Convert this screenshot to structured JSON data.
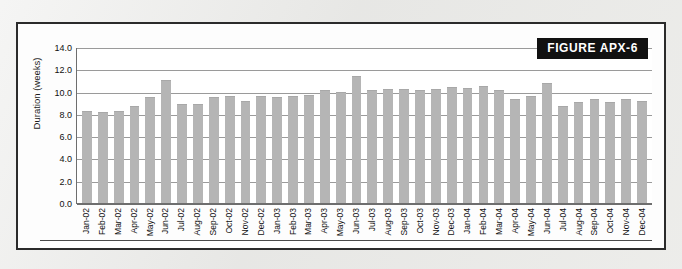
{
  "figure": {
    "tag_label": "FIGURE APX-6"
  },
  "chart_data": {
    "type": "bar",
    "title": "FIGURE APX-6",
    "xlabel": "",
    "ylabel": "Duration (weeks)",
    "ylim": [
      0.0,
      14.0
    ],
    "ytick_labels": [
      "14.0",
      "12.0",
      "10.0",
      "8.0",
      "6.0",
      "4.0",
      "2.0",
      "0.0"
    ],
    "ytick_values": [
      14.0,
      12.0,
      10.0,
      8.0,
      6.0,
      4.0,
      2.0,
      0.0
    ],
    "grid": true,
    "legend": "none",
    "bar_color": "#b5b5b5",
    "categories": [
      "Jan-02",
      "Feb-02",
      "Mar-02",
      "Apr-02",
      "May-02",
      "Jun-02",
      "Jul-02",
      "Aug-02",
      "Sep-02",
      "Oct-02",
      "Nov-02",
      "Dec-02",
      "Jan-03",
      "Feb-03",
      "Mar-03",
      "Apr-03",
      "May-03",
      "Jun-03",
      "Jul-03",
      "Aug-03",
      "Sep-03",
      "Oct-03",
      "Nov-03",
      "Dec-03",
      "Jan-04",
      "Feb-04",
      "Mar-04",
      "Apr-04",
      "May-04",
      "Jun-04",
      "Jul-04",
      "Aug-04",
      "Sep-04",
      "Oct-04",
      "Nov-04",
      "Dec-04"
    ],
    "values": [
      8.3,
      8.2,
      8.3,
      8.7,
      9.5,
      11.0,
      8.9,
      8.9,
      9.5,
      9.6,
      9.2,
      9.6,
      9.5,
      9.6,
      9.7,
      10.1,
      10.0,
      11.4,
      10.1,
      10.2,
      10.2,
      10.1,
      10.2,
      10.4,
      10.3,
      10.5,
      10.1,
      9.3,
      9.6,
      10.8,
      8.7,
      9.1,
      9.3,
      9.1,
      9.3,
      9.2
    ]
  },
  "colors": {
    "page_background": "#e9e9e7",
    "panel_background": "#fdfdfd",
    "panel_border": "#2b2b2b",
    "tag_background": "#111111",
    "tag_text": "#ffffff",
    "bar_fill": "#b5b5b5",
    "gridline": "#9a9a9a",
    "axis": "#6e6e6e",
    "text": "#111111"
  }
}
